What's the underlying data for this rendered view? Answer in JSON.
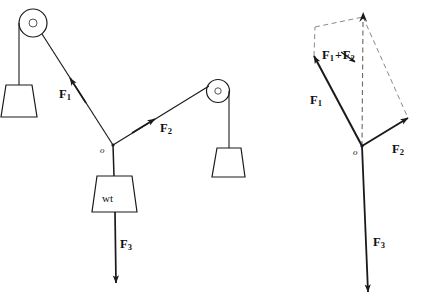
{
  "figure": {
    "stroke_color": "#1a1a1a",
    "dash_color": "#8a8a8a",
    "background": "#ffffff"
  },
  "left_diagram": {
    "name": "pulley-apparatus",
    "origin_label": "o",
    "weight_box_label": "wt",
    "labels": {
      "f1": {
        "base": "F",
        "sub": "1"
      },
      "f2": {
        "base": "F",
        "sub": "2"
      },
      "f3": {
        "base": "F",
        "sub": "3"
      }
    },
    "pulleys": [
      {
        "name": "left-pulley",
        "cx": 33,
        "cy": 23,
        "r": 14,
        "hub_r": 4
      },
      {
        "name": "right-pulley",
        "cx": 218,
        "cy": 91,
        "r": 11.5,
        "hub_r": 3.2
      }
    ],
    "hanging_weights": [
      {
        "name": "left-hanging-weight",
        "cord_x": 19,
        "cord_top": 23,
        "cord_bottom": 85,
        "top_w": 26,
        "bottom_w": 36,
        "height": 32
      },
      {
        "name": "right-hanging-weight",
        "cord_x": 229,
        "cord_top": 91,
        "cord_bottom": 148,
        "top_w": 24,
        "bottom_w": 33,
        "height": 29
      }
    ],
    "junction": {
      "x": 113,
      "y": 145
    },
    "cords": {
      "f1_end": {
        "x": 42,
        "y": 34
      },
      "f2_end": {
        "x": 209,
        "y": 86
      },
      "f3_end": {
        "x": 116,
        "y": 283
      }
    }
  },
  "right_diagram": {
    "name": "force-parallelogram",
    "origin_label": "o",
    "labels": {
      "f1": {
        "base": "F",
        "sub": "1"
      },
      "f2": {
        "base": "F",
        "sub": "2"
      },
      "f3": {
        "base": "F",
        "sub": "3"
      },
      "resultant": {
        "first": "F",
        "first_sub": "1",
        "plus": "+",
        "second": "F",
        "second_sub": "2"
      }
    },
    "origin": {
      "x": 362,
      "y": 146
    },
    "vectors": {
      "f1_tip": {
        "x": 314,
        "y": 56
      },
      "f2_tip": {
        "x": 408,
        "y": 118
      },
      "resultant_tip": {
        "x": 363,
        "y": 17
      },
      "f3_tip": {
        "x": 368,
        "y": 292
      }
    },
    "parallelogram_corner": {
      "x": 315,
      "y": 27
    }
  },
  "text_positions": {
    "left_f1": {
      "x": 59,
      "y": 88
    },
    "left_f2": {
      "x": 160,
      "y": 122
    },
    "left_f3": {
      "x": 120,
      "y": 238
    },
    "left_origin": {
      "x": 100,
      "y": 146
    },
    "left_wt": {
      "x": 102,
      "y": 193
    },
    "right_f1": {
      "x": 310,
      "y": 94
    },
    "right_f2": {
      "x": 392,
      "y": 143
    },
    "right_f3": {
      "x": 373,
      "y": 236
    },
    "right_origin": {
      "x": 353,
      "y": 148
    },
    "right_resultant": {
      "x": 322,
      "y": 49
    }
  }
}
